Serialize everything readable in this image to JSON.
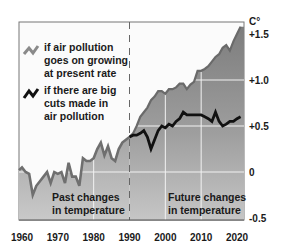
{
  "chart_data": {
    "type": "area",
    "title": "",
    "xlabel": "",
    "ylabel": "C°",
    "x_ticks": [
      "1960",
      "1970",
      "1980",
      "1990",
      "2000",
      "2010",
      "2020"
    ],
    "y_ticks": [
      "+1.5",
      "+1.0",
      "+0.5",
      "0",
      "-0.5"
    ],
    "ylim": [
      -0.5,
      1.6
    ],
    "xlim": [
      1959,
      2022
    ],
    "grid": true,
    "divider_year": 1990,
    "annotations": {
      "past": [
        "Past changes",
        "in temperature"
      ],
      "future": [
        "Future changes",
        "in temperature"
      ]
    },
    "legend": [
      {
        "label_lines": [
          "if air pollution",
          "goes on growing",
          "at present rate"
        ],
        "color": "#8a8a8a"
      },
      {
        "label_lines": [
          "if there are big",
          "cuts made in",
          "air pollution"
        ],
        "color": "#111111"
      }
    ],
    "series": [
      {
        "name": "Past changes in temperature",
        "x": [
          1959,
          1960,
          1961,
          1962,
          1963,
          1964,
          1965,
          1966,
          1967,
          1968,
          1969,
          1970,
          1971,
          1972,
          1973,
          1974,
          1975,
          1976,
          1977,
          1978,
          1979,
          1980,
          1981,
          1982,
          1983,
          1984,
          1985,
          1986,
          1987,
          1988,
          1989,
          1990
        ],
        "values": [
          0.02,
          0.05,
          0.0,
          -0.02,
          -0.25,
          -0.15,
          -0.1,
          -0.05,
          0.0,
          -0.12,
          0.0,
          -0.02,
          0.0,
          -0.12,
          0.1,
          -0.05,
          -0.05,
          -0.15,
          0.15,
          0.12,
          0.12,
          0.15,
          0.25,
          0.32,
          0.18,
          0.28,
          0.15,
          0.12,
          0.25,
          0.32,
          0.35,
          0.38
        ]
      },
      {
        "name": "if air pollution goes on growing at present rate",
        "x": [
          1990,
          1991,
          1992,
          1993,
          1994,
          1995,
          1996,
          1997,
          1998,
          1999,
          2000,
          2001,
          2002,
          2003,
          2004,
          2005,
          2006,
          2007,
          2008,
          2009,
          2010,
          2011,
          2012,
          2013,
          2014,
          2015,
          2016,
          2017,
          2018,
          2019,
          2020,
          2021
        ],
        "values": [
          0.38,
          0.42,
          0.5,
          0.6,
          0.65,
          0.7,
          0.78,
          0.82,
          0.88,
          0.88,
          0.85,
          0.9,
          0.9,
          0.92,
          0.96,
          0.96,
          0.9,
          0.95,
          0.98,
          1.1,
          1.1,
          1.12,
          1.15,
          1.2,
          1.25,
          1.28,
          1.35,
          1.38,
          1.32,
          1.42,
          1.5,
          1.58
        ]
      },
      {
        "name": "if there are big cuts made in air pollution",
        "x": [
          1990,
          1991,
          1992,
          1993,
          1994,
          1995,
          1996,
          1997,
          1998,
          1999,
          2000,
          2001,
          2002,
          2003,
          2004,
          2005,
          2006,
          2007,
          2008,
          2009,
          2010,
          2011,
          2012,
          2013,
          2014,
          2015,
          2016,
          2017,
          2018,
          2019,
          2020,
          2021
        ],
        "values": [
          0.38,
          0.4,
          0.4,
          0.42,
          0.45,
          0.38,
          0.25,
          0.35,
          0.45,
          0.5,
          0.48,
          0.52,
          0.5,
          0.55,
          0.58,
          0.65,
          0.62,
          0.62,
          0.62,
          0.62,
          0.62,
          0.6,
          0.58,
          0.55,
          0.65,
          0.55,
          0.5,
          0.52,
          0.55,
          0.55,
          0.58,
          0.6
        ]
      }
    ]
  }
}
